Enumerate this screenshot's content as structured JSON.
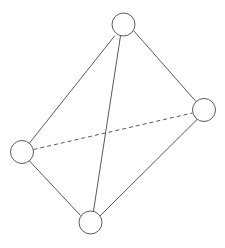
{
  "canvas": {
    "width": 225,
    "height": 248,
    "background_color": "#ffffff"
  },
  "diagram": {
    "title": "",
    "type": "node-link-graph",
    "node_count": 4,
    "edge_count": 6,
    "style": {
      "node_stroke_color": "#5a5a5a",
      "node_fill_color": "#ffffff",
      "node_stroke_width": 1,
      "node_radius": 11.5,
      "edge_stroke_color": "#5a5a5a",
      "edge_stroke_width": 1,
      "hidden_edge_dash": "4,3"
    },
    "nodes": [
      {
        "id": "n-top",
        "label": "",
        "cx": 123.5,
        "cy": 24.5,
        "r": 11.5
      },
      {
        "id": "n-right",
        "label": "",
        "cx": 204.0,
        "cy": 110.0,
        "r": 11.5
      },
      {
        "id": "n-left",
        "label": "",
        "cx": 22.0,
        "cy": 152.0,
        "r": 11.5
      },
      {
        "id": "n-bottom",
        "label": "",
        "cx": 90.5,
        "cy": 222.5,
        "r": 11.5
      }
    ],
    "edges": [
      {
        "id": "e-top-left",
        "from": "n-top",
        "to": "n-left",
        "style": "solid",
        "x1": 115.0,
        "y1": 35.5,
        "x2": 29.5,
        "y2": 143.0
      },
      {
        "id": "e-top-right",
        "from": "n-top",
        "to": "n-right",
        "style": "solid",
        "x1": 133.5,
        "y1": 30.5,
        "x2": 196.0,
        "y2": 101.5
      },
      {
        "id": "e-top-bottom",
        "from": "n-top",
        "to": "n-bottom",
        "style": "solid",
        "x1": 120.5,
        "y1": 36.0,
        "x2": 93.5,
        "y2": 211.0
      },
      {
        "id": "e-left-bottom",
        "from": "n-left",
        "to": "n-bottom",
        "style": "solid",
        "x1": 29.5,
        "y1": 161.0,
        "x2": 80.5,
        "y2": 215.5
      },
      {
        "id": "e-right-bottom",
        "from": "n-right",
        "to": "n-bottom",
        "style": "solid",
        "x1": 197.0,
        "y1": 119.5,
        "x2": 100.0,
        "y2": 216.0
      },
      {
        "id": "e-left-right",
        "from": "n-left",
        "to": "n-right",
        "style": "dashed",
        "x1": 33.5,
        "y1": 149.5,
        "x2": 192.5,
        "y2": 113.0
      }
    ]
  }
}
